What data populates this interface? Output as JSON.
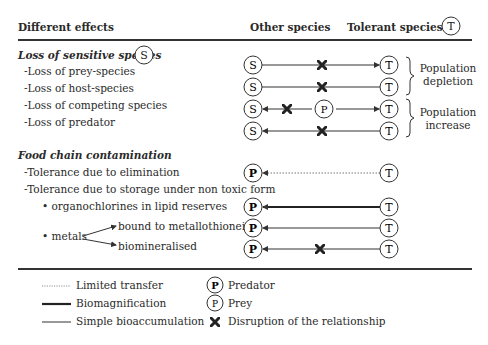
{
  "header": {
    "col1": "Different effects",
    "col2": "Other species",
    "col3": "Tolerant species",
    "col3_symbol": "T"
  },
  "section1": {
    "title": "Loss of sensitive species",
    "symbol": "S",
    "items": [
      "-Loss of prey-species",
      "-Loss of host-species",
      "-Loss of competing species",
      "-Loss of predator"
    ],
    "groups": [
      {
        "label_line1": "Population",
        "label_line2": "depletion"
      },
      {
        "label_line1": "Population",
        "label_line2": "increase"
      }
    ]
  },
  "section2": {
    "title": "Food chain contamination",
    "items": [
      "-Tolerance due to elimination",
      "-Tolerance due to storage under non toxic form"
    ],
    "sub_items": [
      "• organochlorines in lipid reserves",
      "• metals"
    ],
    "metal_forms": [
      "bound to metallothionein",
      "biomineralised"
    ]
  },
  "nodes": {
    "S": "S",
    "T": "T",
    "P": "P",
    "p": "p"
  },
  "legend": {
    "limited_transfer": "Limited transfer",
    "biomagnification": "Biomagnification",
    "simple_bioaccumulation": "Simple bioaccumulation",
    "predator": "Predator",
    "predator_symbol": "P",
    "prey": "Prey",
    "prey_symbol": "p",
    "disruption": "Disruption of the relationship"
  }
}
